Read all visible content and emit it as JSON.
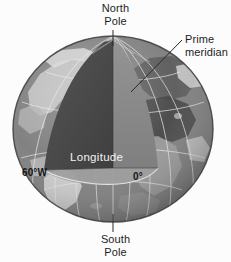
{
  "figure": {
    "background_color": "#fcfcfc"
  },
  "labels": {
    "north_pole": {
      "line1": "North",
      "line2": "Pole"
    },
    "south_pole": {
      "line1": "South",
      "line2": "Pole"
    },
    "prime_meridian": {
      "line1": "Prime",
      "line2": "meridian"
    },
    "longitude": "Longitude",
    "west_60": "60°W",
    "zero_deg": "0°"
  },
  "colors": {
    "ocean": "#7d7d7d",
    "land_light": "#c9c9c9",
    "land_dark": "#4f4f4f",
    "wedge_dark_face": "#4a4a4a",
    "wedge_light_face": "#8c8c8c",
    "wedge_equator_face": "#9a9a9a",
    "graticule": "#e8e8e8",
    "leader_line": "#2a2a2a",
    "label_text": "#1c1c1c",
    "label_text_inverse": "#f2f2f2",
    "outline": "#3a3a3a"
  },
  "globe": {
    "center_x": 113,
    "center_y": 129,
    "radius_x": 100,
    "radius_y": 93,
    "meridian_count": 12,
    "latitude_count": 5
  },
  "leader_lines": [
    {
      "name": "north-pole-leader",
      "x1": 113,
      "y1": 30,
      "x2": 113,
      "y2": 46
    },
    {
      "name": "south-pole-leader",
      "x1": 113,
      "y1": 214,
      "x2": 113,
      "y2": 232
    },
    {
      "name": "prime-meridian-leader",
      "x1": 182,
      "y1": 40,
      "x2": 131,
      "y2": 92
    }
  ]
}
